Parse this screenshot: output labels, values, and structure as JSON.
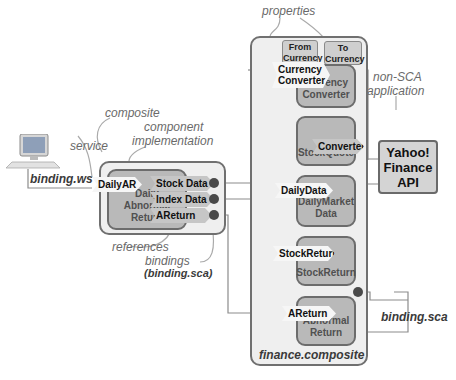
{
  "annotations": {
    "properties": "properties",
    "composite": "composite",
    "component_implementation_1": "component",
    "component_implementation_2": "implementation",
    "service": "service",
    "non_sca_1": "non-SCA",
    "non_sca_2": "application",
    "references": "references",
    "bindings": "bindings",
    "bindings_sca": "(binding.sca)",
    "binding_ws": "binding.ws",
    "binding_sca": "binding.sca",
    "finance_composite": "finance.composite"
  },
  "left_composite": {
    "component": {
      "label_lines": [
        "Daily",
        "Abnormal",
        "Return"
      ]
    },
    "service": "DailyAR",
    "references": [
      "Stock Data",
      "Index Data",
      "AReturn"
    ]
  },
  "finance_composite": {
    "properties": [
      {
        "line1": "From",
        "line2": "Currency"
      },
      {
        "line1": "To",
        "line2": "Currency"
      }
    ],
    "components": [
      {
        "name": "currency-converter",
        "service": "Currency Converter",
        "service_lines": [
          "Currency",
          "Converter"
        ],
        "label_lines": [
          "Currency",
          "Converter"
        ]
      },
      {
        "name": "stock-quote",
        "reference": "Converter",
        "label_lines": [
          "StockQuote"
        ]
      },
      {
        "name": "daily-market-data",
        "service": "DailyData",
        "label_lines": [
          "DailyMarket",
          "Data"
        ]
      },
      {
        "name": "stock-return",
        "service": "StockReturn",
        "label_lines": [
          "StockReturn"
        ]
      },
      {
        "name": "abnormal-return",
        "service": "AReturn",
        "label_lines": [
          "Abnormal",
          "Return"
        ]
      }
    ]
  },
  "external": {
    "lines": [
      "Yahoo!",
      "Finance",
      "API"
    ]
  },
  "colors": {
    "composite_bg": "#efefef",
    "component_bg": "#b9b9b9",
    "border": "#6c6c6c",
    "line": "#8a8a8a",
    "dot": "#4a4a4a"
  }
}
